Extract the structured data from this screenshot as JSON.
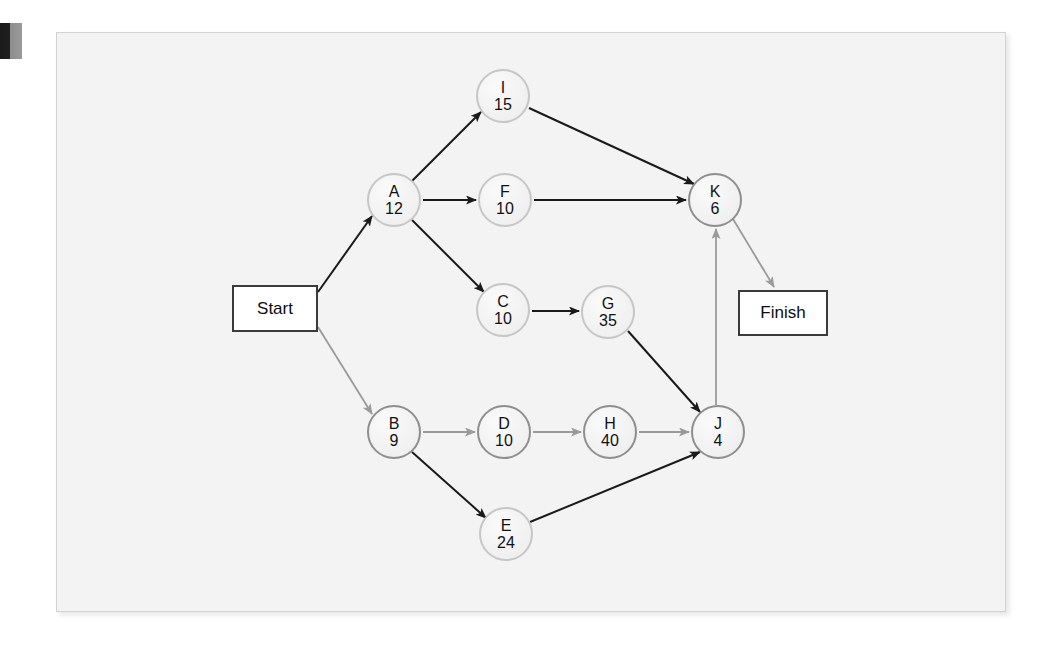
{
  "figure": {
    "kind": "activity-on-node network diagram",
    "background_color": "#f3f3f3",
    "frame_border_color": "#d2d2d2",
    "node_fill_color": "#f0f0f0",
    "node_stroke_light": "#c6c6c6",
    "node_stroke_dark": "#8e8e8e",
    "arrow_color_dark": "#1a1a1a",
    "arrow_color_light": "#9a9a9a",
    "terminal_border_color": "#3a3a3a"
  },
  "terminals": [
    {
      "key": "start",
      "label": "Start",
      "x": 232,
      "y": 285,
      "w": 86,
      "h": 47
    },
    {
      "key": "finish",
      "label": "Finish",
      "x": 738,
      "y": 290,
      "w": 90,
      "h": 46
    }
  ],
  "nodes": [
    {
      "key": "I",
      "id": "I",
      "duration": "15",
      "cx": 503,
      "cy": 96,
      "r": 27,
      "stroke": "light"
    },
    {
      "key": "A",
      "id": "A",
      "duration": "12",
      "cx": 394,
      "cy": 200,
      "r": 27,
      "stroke": "light"
    },
    {
      "key": "F",
      "id": "F",
      "duration": "10",
      "cx": 505,
      "cy": 200,
      "r": 27,
      "stroke": "light"
    },
    {
      "key": "K",
      "id": "K",
      "duration": "6",
      "cx": 715,
      "cy": 200,
      "r": 27,
      "stroke": "dark"
    },
    {
      "key": "C",
      "id": "C",
      "duration": "10",
      "cx": 503,
      "cy": 310,
      "r": 27,
      "stroke": "light"
    },
    {
      "key": "G",
      "id": "G",
      "duration": "35",
      "cx": 608,
      "cy": 312,
      "r": 27,
      "stroke": "light"
    },
    {
      "key": "B",
      "id": "B",
      "duration": "9",
      "cx": 394,
      "cy": 432,
      "r": 27,
      "stroke": "dark"
    },
    {
      "key": "D",
      "id": "D",
      "duration": "10",
      "cx": 504,
      "cy": 432,
      "r": 27,
      "stroke": "dark"
    },
    {
      "key": "H",
      "id": "H",
      "duration": "40",
      "cx": 610,
      "cy": 432,
      "r": 27,
      "stroke": "dark"
    },
    {
      "key": "J",
      "id": "J",
      "duration": "4",
      "cx": 718,
      "cy": 432,
      "r": 27,
      "stroke": "dark"
    },
    {
      "key": "E",
      "id": "E",
      "duration": "24",
      "cx": 506,
      "cy": 534,
      "r": 27,
      "stroke": "light"
    }
  ],
  "edges": [
    {
      "from": "start",
      "to": "A",
      "x1": 318,
      "y1": 292,
      "x2": 372,
      "y2": 216,
      "tone": "dark"
    },
    {
      "from": "start",
      "to": "B",
      "x1": 318,
      "y1": 327,
      "x2": 372,
      "y2": 414,
      "tone": "light"
    },
    {
      "from": "A",
      "to": "I",
      "x1": 412,
      "y1": 181,
      "x2": 481,
      "y2": 112,
      "tone": "dark"
    },
    {
      "from": "A",
      "to": "F",
      "x1": 423,
      "y1": 200,
      "x2": 476,
      "y2": 200,
      "tone": "dark"
    },
    {
      "from": "A",
      "to": "C",
      "x1": 412,
      "y1": 220,
      "x2": 484,
      "y2": 292,
      "tone": "dark"
    },
    {
      "from": "I",
      "to": "K",
      "x1": 529,
      "y1": 108,
      "x2": 694,
      "y2": 184,
      "tone": "dark"
    },
    {
      "from": "F",
      "to": "K",
      "x1": 534,
      "y1": 200,
      "x2": 686,
      "y2": 200,
      "tone": "dark"
    },
    {
      "from": "C",
      "to": "G",
      "x1": 532,
      "y1": 311,
      "x2": 579,
      "y2": 311,
      "tone": "dark"
    },
    {
      "from": "G",
      "to": "J",
      "x1": 628,
      "y1": 331,
      "x2": 700,
      "y2": 412,
      "tone": "dark"
    },
    {
      "from": "B",
      "to": "D",
      "x1": 423,
      "y1": 432,
      "x2": 475,
      "y2": 432,
      "tone": "light"
    },
    {
      "from": "B",
      "to": "E",
      "x1": 412,
      "y1": 452,
      "x2": 486,
      "y2": 518,
      "tone": "dark"
    },
    {
      "from": "D",
      "to": "H",
      "x1": 533,
      "y1": 432,
      "x2": 581,
      "y2": 432,
      "tone": "light"
    },
    {
      "from": "H",
      "to": "J",
      "x1": 639,
      "y1": 432,
      "x2": 689,
      "y2": 432,
      "tone": "light"
    },
    {
      "from": "E",
      "to": "J",
      "x1": 530,
      "y1": 522,
      "x2": 700,
      "y2": 452,
      "tone": "dark"
    },
    {
      "from": "J",
      "to": "K",
      "x1": 716,
      "y1": 405,
      "x2": 716,
      "y2": 229,
      "tone": "light"
    },
    {
      "from": "K",
      "to": "finish",
      "x1": 733,
      "y1": 219,
      "x2": 774,
      "y2": 287,
      "tone": "light"
    }
  ],
  "edge_markers": {
    "dark": "arrowhead-dark",
    "light": "arrowhead-light"
  }
}
